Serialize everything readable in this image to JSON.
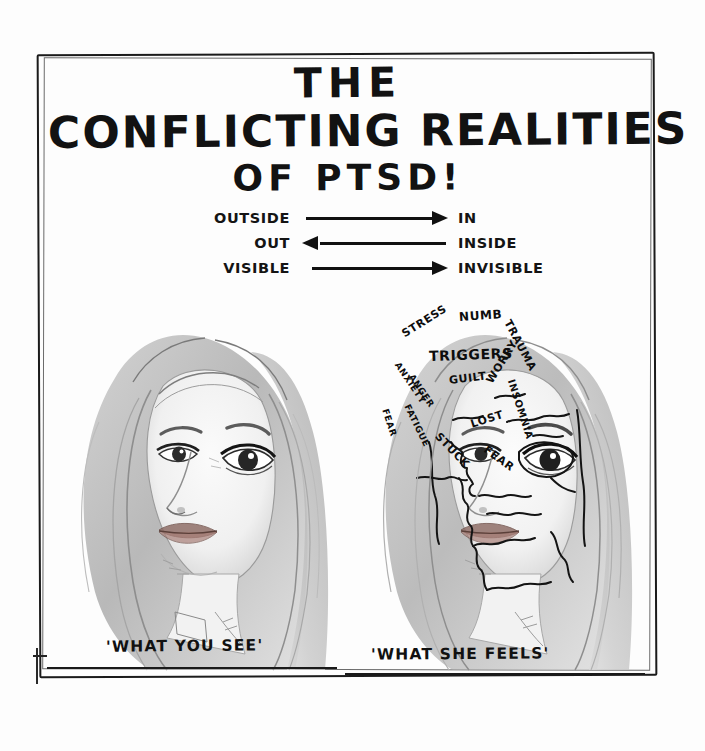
{
  "artwork": {
    "medium": "pencil-drawing",
    "background_color": "#fdfdfd",
    "ink_color": "#111111"
  },
  "title": {
    "line1": "THE",
    "line2": "CONFLICTING REALITIES",
    "line3": "OF PTSD!"
  },
  "dualities": [
    {
      "left": "OUTSIDE",
      "right": "IN",
      "direction": "right"
    },
    {
      "left": "OUT",
      "right": "INSIDE",
      "direction": "left"
    },
    {
      "left": "VISIBLE",
      "right": "INVISIBLE",
      "direction": "right"
    }
  ],
  "panels": {
    "left": {
      "caption": "'WHAT YOU SEE'",
      "description": "pencil portrait of a young woman, calm expression, long hair"
    },
    "right": {
      "caption": "'WHAT SHE FEELS'",
      "description": "same portrait with face fragmented into jigsaw pieces labelled with PTSD symptoms",
      "overlay_words": [
        {
          "text": "STRESS",
          "x": 48,
          "y": 46,
          "rotate": -32,
          "size": 11
        },
        {
          "text": "NUMB",
          "x": 104,
          "y": 28,
          "rotate": -4,
          "size": 12
        },
        {
          "text": "TRAUMA",
          "x": 152,
          "y": 32,
          "rotate": 62,
          "size": 11
        },
        {
          "text": "TRIGGERS",
          "x": 74,
          "y": 66,
          "rotate": -2,
          "size": 14
        },
        {
          "text": "ANXIETY",
          "x": 42,
          "y": 76,
          "rotate": 56,
          "size": 9
        },
        {
          "text": "ANGER",
          "x": 56,
          "y": 88,
          "rotate": 56,
          "size": 9
        },
        {
          "text": "GUILT",
          "x": 94,
          "y": 92,
          "rotate": -7,
          "size": 11
        },
        {
          "text": "WORRY",
          "x": 134,
          "y": 94,
          "rotate": -58,
          "size": 11
        },
        {
          "text": "INSOMNIA",
          "x": 156,
          "y": 92,
          "rotate": 72,
          "size": 10
        },
        {
          "text": "FATIGUE",
          "x": 52,
          "y": 118,
          "rotate": 64,
          "size": 9
        },
        {
          "text": "FEAR",
          "x": 30,
          "y": 122,
          "rotate": 72,
          "size": 9
        },
        {
          "text": "LOST",
          "x": 116,
          "y": 136,
          "rotate": -18,
          "size": 11
        },
        {
          "text": "STUCK",
          "x": 82,
          "y": 146,
          "rotate": 46,
          "size": 11
        },
        {
          "text": "FEAR",
          "x": 130,
          "y": 160,
          "rotate": 36,
          "size": 11
        }
      ]
    }
  }
}
